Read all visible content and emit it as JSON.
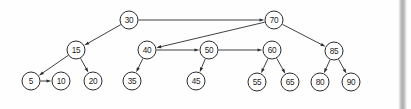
{
  "diagram": {
    "background_color": "#fefefe",
    "node_fill": "#ffffff",
    "node_stroke": "#2b2b2b",
    "edge_color": "#2b2b2b",
    "node_radius": 9,
    "nodes": [
      {
        "id": "n30",
        "label": "30",
        "cx": 129,
        "cy": 20,
        "level": 0
      },
      {
        "id": "n70",
        "label": "70",
        "cx": 274,
        "cy": 20,
        "level": 0
      },
      {
        "id": "n15",
        "label": "15",
        "cx": 76,
        "cy": 50,
        "level": 1
      },
      {
        "id": "n40",
        "label": "40",
        "cx": 147,
        "cy": 50,
        "level": 1
      },
      {
        "id": "n50",
        "label": "50",
        "cx": 209,
        "cy": 50,
        "level": 1
      },
      {
        "id": "n60",
        "label": "60",
        "cx": 272,
        "cy": 50,
        "level": 1
      },
      {
        "id": "n85",
        "label": "85",
        "cx": 334,
        "cy": 51,
        "level": 1
      },
      {
        "id": "n5",
        "label": "5",
        "cx": 31,
        "cy": 81,
        "level": 2
      },
      {
        "id": "n10",
        "label": "10",
        "cx": 61,
        "cy": 81,
        "level": 2
      },
      {
        "id": "n20",
        "label": "20",
        "cx": 93,
        "cy": 81,
        "level": 2
      },
      {
        "id": "n35",
        "label": "35",
        "cx": 132,
        "cy": 81,
        "level": 2
      },
      {
        "id": "n45",
        "label": "45",
        "cx": 196,
        "cy": 81,
        "level": 2
      },
      {
        "id": "n55",
        "label": "55",
        "cx": 257,
        "cy": 82,
        "level": 2
      },
      {
        "id": "n65",
        "label": "65",
        "cx": 290,
        "cy": 82,
        "level": 2
      },
      {
        "id": "n80",
        "label": "80",
        "cx": 320,
        "cy": 82,
        "level": 2
      },
      {
        "id": "n90",
        "label": "90",
        "cx": 351,
        "cy": 82,
        "level": 2
      }
    ],
    "edges": [
      {
        "from": "n30",
        "to": "n70",
        "kind": "horizontal-link"
      },
      {
        "from": "n30",
        "to": "n15",
        "kind": "child-link"
      },
      {
        "from": "n70",
        "to": "n40",
        "kind": "long-link"
      },
      {
        "from": "n70",
        "to": "n85",
        "kind": "child-link"
      },
      {
        "from": "n15",
        "to": "n5",
        "kind": "child-link"
      },
      {
        "from": "n15",
        "to": "n20",
        "kind": "child-link"
      },
      {
        "from": "n5",
        "to": "n10",
        "kind": "horizontal-link"
      },
      {
        "from": "n40",
        "to": "n50",
        "kind": "horizontal-link"
      },
      {
        "from": "n40",
        "to": "n35",
        "kind": "child-link"
      },
      {
        "from": "n50",
        "to": "n60",
        "kind": "horizontal-link"
      },
      {
        "from": "n50",
        "to": "n45",
        "kind": "child-link"
      },
      {
        "from": "n60",
        "to": "n55",
        "kind": "child-link"
      },
      {
        "from": "n60",
        "to": "n65",
        "kind": "child-link"
      },
      {
        "from": "n85",
        "to": "n80",
        "kind": "child-link"
      },
      {
        "from": "n85",
        "to": "n90",
        "kind": "child-link"
      }
    ]
  },
  "scrollbar": {
    "name": "vertical-scrollbar",
    "left": 398,
    "width": 9,
    "track_color": "#aeaeae"
  }
}
